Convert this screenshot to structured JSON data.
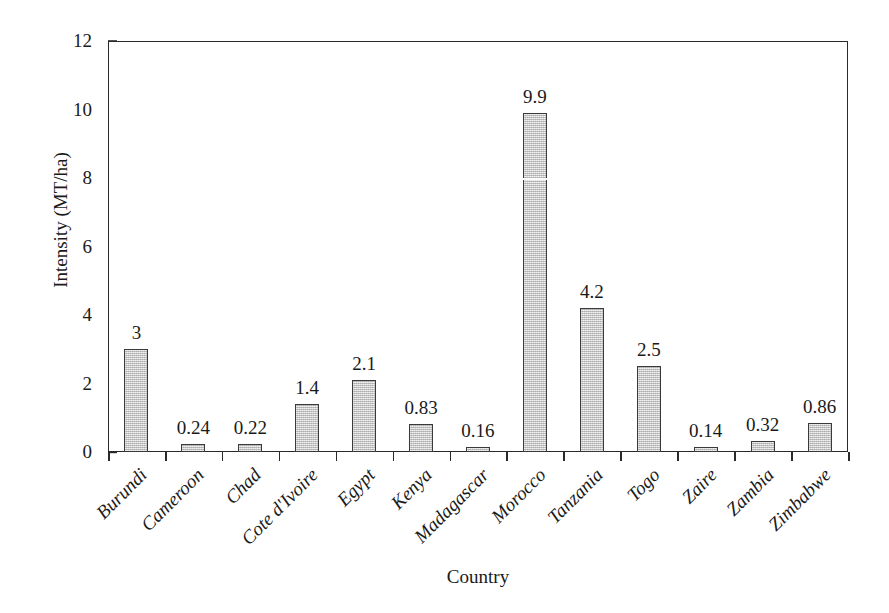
{
  "chart_data": {
    "type": "bar",
    "title": "",
    "subtitle": "",
    "xlabel": "Country",
    "ylabel": "Intensity (MT/ha)",
    "categories": [
      "Burundi",
      "Cameroon",
      "Chad",
      "Cote d'Ivoire",
      "Egypt",
      "Kenya",
      "Madagascar",
      "Morocco",
      "Tanzania",
      "Togo",
      "Zaire",
      "Zambia",
      "Zimbabwe"
    ],
    "values": [
      3,
      0.24,
      0.22,
      1.4,
      2.1,
      0.83,
      0.16,
      9.9,
      4.2,
      2.5,
      0.14,
      0.32,
      0.86
    ],
    "value_labels": [
      "3",
      "0.24",
      "0.22",
      "1.4",
      "2.1",
      "0.83",
      "0.16",
      "9.9",
      "4.2",
      "2.5",
      "0.14",
      "0.32",
      "0.86"
    ],
    "ylim": [
      0,
      12
    ],
    "yticks": [
      0,
      2,
      4,
      6,
      8,
      10,
      12
    ],
    "ytick_labels": [
      "0",
      "2",
      "4",
      "6",
      "8",
      "10",
      "12"
    ],
    "grid": false,
    "legend": false,
    "legend_position": "none",
    "bar_fill_color": "#c9c9c9",
    "bar_edge_color": "#3a3a3a",
    "axis_color": "#2a2a2a",
    "text_color": "#1a1a1a",
    "background_color": "#ffffff"
  }
}
